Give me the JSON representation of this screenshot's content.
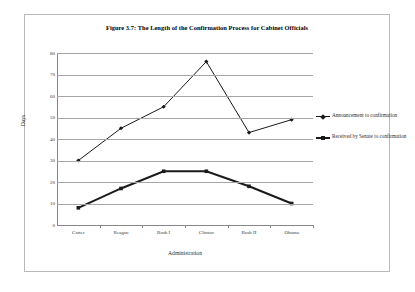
{
  "figure": {
    "title": "Figure 3.7: The Length of the Confirmation Process for Cabinet Officials"
  },
  "legend": {
    "entries": [
      {
        "label": "Announcement to confirmation",
        "marker": "diamond-marker"
      },
      {
        "label": "Received by Senate to confirmation",
        "marker": "square-marker"
      }
    ]
  },
  "chart_data": {
    "type": "line",
    "title": "Figure 3.7: The Length of the Confirmation Process for Cabinet Officials",
    "xlabel": "Administration",
    "ylabel": "Days",
    "categories": [
      "Carter",
      "Reagan",
      "Bush I",
      "Clinton",
      "Bush II",
      "Obama"
    ],
    "yticks": [
      0,
      10,
      20,
      30,
      40,
      50,
      60,
      70,
      80
    ],
    "ytick_labels": [
      "0",
      "10",
      "20",
      "30",
      "40",
      "50",
      "60",
      "70",
      "80"
    ],
    "ylim": [
      0,
      80
    ],
    "grid": "horizontal",
    "legend_position": "right",
    "series": [
      {
        "name": "Announcement to confirmation",
        "values": [
          30,
          45,
          55,
          76,
          43,
          49
        ],
        "color": "#1a1a1a",
        "marker": "diamond",
        "line_width": 1
      },
      {
        "name": "Received by Senate to confirmation",
        "values": [
          8,
          17,
          25,
          25,
          18,
          10
        ],
        "color": "#1a1a1a",
        "marker": "square",
        "line_width": 2
      }
    ]
  }
}
